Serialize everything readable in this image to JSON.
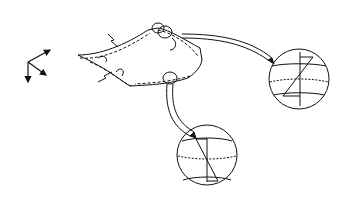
{
  "diagram": {
    "axes": {
      "x": "x",
      "y": "y",
      "z": "z"
    },
    "labels": {
      "rx": {
        "main": "R",
        "sub": "x",
        "eq": "= 1/κ",
        "eq_sub": "x"
      },
      "ry": {
        "main": "R",
        "sub": "y",
        "eq": "= 1/κ",
        "eq_sub": "y"
      },
      "mx_left": {
        "main": "M",
        "sub": "x"
      },
      "mx_right": {
        "main": "M",
        "sub": "x"
      }
    },
    "strain_y": {
      "symbol": "ε",
      "sub": "y",
      "value": "0.0175  %",
      "top_sign": "+",
      "bottom_sign": "-"
    },
    "strain_x": {
      "symbol": "ε",
      "sub": "x",
      "value": "0.05  %",
      "top_sign": "-",
      "bottom_sign": "+"
    },
    "colors": {
      "ink": "#111111",
      "background": "#ffffff"
    }
  }
}
